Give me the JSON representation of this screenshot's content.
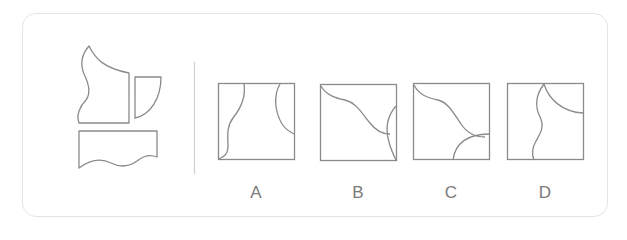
{
  "puzzle": {
    "type": "spatial-reasoning",
    "given_pieces": [
      "wavy-left-piece",
      "quarter-circle-piece",
      "wavy-bottom-rectangle-piece"
    ],
    "options": [
      {
        "label": "A"
      },
      {
        "label": "B"
      },
      {
        "label": "C"
      },
      {
        "label": "D"
      }
    ]
  },
  "colors": {
    "stroke": "#8a8a8a",
    "card_border": "#e4e4e4",
    "divider": "#cfcfcf",
    "label": "#7a7a7a"
  }
}
